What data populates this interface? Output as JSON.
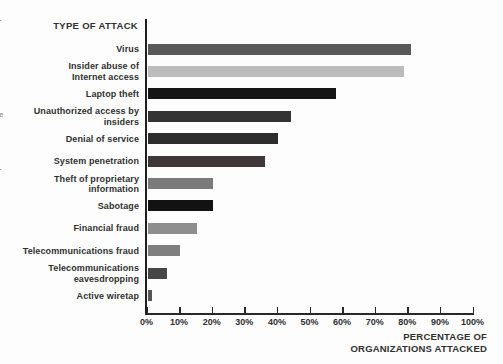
{
  "figure": {
    "title": "TYPE OF ATTACK",
    "x_axis_title_line1": "PERCENTAGE OF",
    "x_axis_title_line2": "ORGANIZATIONS ATTACKED"
  },
  "chart_data": {
    "type": "bar",
    "orientation": "horizontal",
    "title": "TYPE OF ATTACK",
    "xlabel": "PERCENTAGE OF ORGANIZATIONS ATTACKED",
    "xlim": [
      0,
      100
    ],
    "grid": false,
    "x_tick_labels": [
      "0%",
      "10%",
      "20%",
      "30%",
      "40%",
      "50%",
      "60%",
      "70%",
      "80%",
      "90%",
      "100%"
    ],
    "categories": [
      "Virus",
      "Insider abuse of Internet access",
      "Laptop theft",
      "Unauthorized access by insiders",
      "Denial of service",
      "System penetration",
      "Theft of proprietary information",
      "Sabotage",
      "Financial fraud",
      "Telecommunications fraud",
      "Telecommunications eavesdropping",
      "Active wiretap"
    ],
    "values": [
      81,
      79,
      58,
      44,
      40,
      36,
      20,
      20,
      15,
      10,
      6,
      1
    ],
    "bar_colors": [
      "#595959",
      "#bcbcbc",
      "#151515",
      "#333333",
      "#2d2d2d",
      "#3f3838",
      "#7a7a7a",
      "#121212",
      "#8e8e8e",
      "#7f7f7f",
      "#474747",
      "#555555"
    ],
    "rows": [
      {
        "label": "Virus",
        "lines": [
          "Virus"
        ],
        "value": 81,
        "color": "#595959"
      },
      {
        "label": "Insider abuse of Internet access",
        "lines": [
          "Insider abuse of",
          "Internet access"
        ],
        "value": 79,
        "color": "#bcbcbc"
      },
      {
        "label": "Laptop theft",
        "lines": [
          "Laptop theft"
        ],
        "value": 58,
        "color": "#151515"
      },
      {
        "label": "Unauthorized access by insiders",
        "lines": [
          "Unauthorized access by",
          "insiders"
        ],
        "value": 44,
        "color": "#333333"
      },
      {
        "label": "Denial of service",
        "lines": [
          "Denial of service"
        ],
        "value": 40,
        "color": "#2d2d2d"
      },
      {
        "label": "System penetration",
        "lines": [
          "System penetration"
        ],
        "value": 36,
        "color": "#3f3838"
      },
      {
        "label": "Theft of proprietary information",
        "lines": [
          "Theft of proprietary",
          "information"
        ],
        "value": 20,
        "color": "#7a7a7a"
      },
      {
        "label": "Sabotage",
        "lines": [
          "Sabotage"
        ],
        "value": 20,
        "color": "#121212"
      },
      {
        "label": "Financial fraud",
        "lines": [
          "Financial fraud"
        ],
        "value": 15,
        "color": "#8e8e8e"
      },
      {
        "label": "Telecommunications fraud",
        "lines": [
          "Telecommunications fraud"
        ],
        "value": 10,
        "color": "#7f7f7f"
      },
      {
        "label": "Telecommunications eavesdropping",
        "lines": [
          "Telecommunications",
          "eavesdropping"
        ],
        "value": 6,
        "color": "#474747"
      },
      {
        "label": "Active wiretap",
        "lines": [
          "Active wiretap"
        ],
        "value": 1,
        "color": "#555555"
      }
    ]
  },
  "scan_artifacts": {
    "edge_marks": [
      "-",
      "e",
      "-"
    ]
  }
}
